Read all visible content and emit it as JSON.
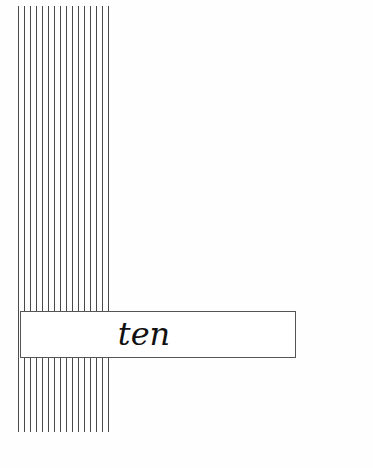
{
  "page": {
    "type": "chapter-opening",
    "chapter_word": "ten",
    "stripes": {
      "count": 16,
      "color": "#4a4a4a"
    },
    "box_border_color": "#555555",
    "background_color": "#ffffff"
  }
}
